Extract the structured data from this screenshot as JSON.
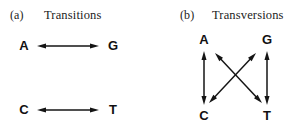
{
  "figure": {
    "width": 296,
    "height": 137,
    "background": "#ffffff",
    "ink_color": "#141414"
  },
  "panels": [
    {
      "letter": "(a)",
      "title": "Transitions",
      "letter_x": 10,
      "letter_y": 8,
      "title_x": 44,
      "title_y": 8,
      "nucleotides": [
        {
          "label": "A",
          "x": 16,
          "y": 38
        },
        {
          "label": "G",
          "x": 105,
          "y": 38
        },
        {
          "label": "C",
          "x": 16,
          "y": 102
        },
        {
          "label": "T",
          "x": 105,
          "y": 102
        }
      ],
      "edges": [
        {
          "from": "A",
          "to": "G",
          "kind": "horizontal",
          "x1": 37,
          "y1": 46,
          "x2": 99,
          "y2": 46
        },
        {
          "from": "C",
          "to": "T",
          "kind": "horizontal",
          "x1": 37,
          "y1": 110,
          "x2": 99,
          "y2": 110
        }
      ]
    },
    {
      "letter": "(b)",
      "title": "Transversions",
      "letter_x": 180,
      "letter_y": 8,
      "title_x": 212,
      "title_y": 8,
      "nucleotides": [
        {
          "label": "A",
          "x": 196,
          "y": 32
        },
        {
          "label": "G",
          "x": 259,
          "y": 32
        },
        {
          "label": "C",
          "x": 196,
          "y": 108
        },
        {
          "label": "T",
          "x": 259,
          "y": 108
        }
      ],
      "edges": [
        {
          "from": "A",
          "to": "C",
          "kind": "vertical",
          "x1": 204,
          "y1": 51,
          "x2": 204,
          "y2": 105
        },
        {
          "from": "G",
          "to": "T",
          "kind": "vertical",
          "x1": 267,
          "y1": 51,
          "x2": 267,
          "y2": 105
        },
        {
          "from": "A",
          "to": "T",
          "kind": "diagonal",
          "x1": 215,
          "y1": 53,
          "x2": 262,
          "y2": 103
        },
        {
          "from": "G",
          "to": "C",
          "kind": "diagonal",
          "x1": 256,
          "y1": 53,
          "x2": 209,
          "y2": 103
        }
      ]
    }
  ],
  "arrow_style": {
    "double_headed": true,
    "head_length": 9,
    "head_width": 5,
    "line_width": 1.5
  }
}
